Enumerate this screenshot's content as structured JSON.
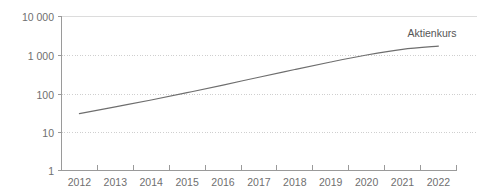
{
  "chart_data": {
    "type": "line",
    "title": "",
    "xlabel": "",
    "ylabel": "",
    "yscale": "log",
    "ylim": [
      1,
      10000
    ],
    "grid": true,
    "legend_position": "inline-right",
    "x": [
      2012,
      2013,
      2014,
      2015,
      2016,
      2017,
      2018,
      2019,
      2020,
      2021,
      2022
    ],
    "categories": [
      "2012",
      "2013",
      "2014",
      "2015",
      "2016",
      "2017",
      "2018",
      "2019",
      "2020",
      "2021",
      "2022"
    ],
    "ytick_labels": [
      "10 000",
      "1 000",
      "100",
      "10",
      "1"
    ],
    "ytick_values": [
      10000,
      1000,
      100,
      10,
      1
    ],
    "series": [
      {
        "name": "Aktienkurs",
        "color": "#6e6e6e",
        "values": [
          30,
          45,
          68,
          105,
          165,
          265,
          420,
          660,
          1000,
          1400,
          1700
        ]
      }
    ],
    "annotations": [
      {
        "text": "Aktienkurs",
        "x": 2021.35,
        "y": 2900
      }
    ]
  },
  "axis": {
    "y_label_10000": "10 000",
    "y_label_1000": "1 000",
    "y_label_100": "100",
    "y_label_10": "10",
    "y_label_1": "1",
    "x_label_2012": "2012",
    "x_label_2013": "2013",
    "x_label_2014": "2014",
    "x_label_2015": "2015",
    "x_label_2016": "2016",
    "x_label_2017": "2017",
    "x_label_2018": "2018",
    "x_label_2019": "2019",
    "x_label_2020": "2020",
    "x_label_2021": "2021",
    "x_label_2022": "2022"
  },
  "series_label": {
    "aktienkurs": "Aktienkurs"
  },
  "colors": {
    "line": "#6e6e6e",
    "grid": "#cfcfcf",
    "axis": "#9a9a9a",
    "text": "#6f6f6f",
    "background": "#ffffff"
  }
}
